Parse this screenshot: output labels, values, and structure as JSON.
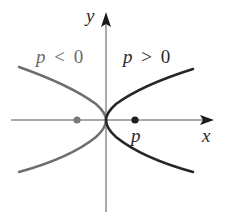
{
  "diagram": {
    "type": "parabolas-opening-horizontally",
    "axes": {
      "x_label": "x",
      "y_label": "y"
    },
    "curves": [
      {
        "name": "left-parabola",
        "condition_label": "p < 0",
        "color": "#6e6e6e"
      },
      {
        "name": "right-parabola",
        "condition_label": "p > 0",
        "color": "#262626"
      }
    ],
    "focus_points": [
      {
        "name": "focus-negative",
        "color": "#7a7a7a"
      },
      {
        "name": "focus-positive",
        "color": "#1e1e1e",
        "label": "p"
      }
    ],
    "labels": {
      "left_condition_var": "p",
      "left_condition_op": "<",
      "left_condition_val": "0",
      "right_condition_var": "p",
      "right_condition_op": ">",
      "right_condition_val": "0",
      "focus_label": "p"
    }
  }
}
